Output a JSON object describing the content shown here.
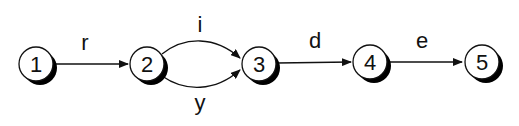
{
  "diagram": {
    "type": "state-transition-graph",
    "nodes": [
      {
        "id": "1",
        "label": "1",
        "cx": 36,
        "cy": 64
      },
      {
        "id": "2",
        "label": "2",
        "cx": 147,
        "cy": 64
      },
      {
        "id": "3",
        "label": "3",
        "cx": 259,
        "cy": 64
      },
      {
        "id": "4",
        "label": "4",
        "cx": 370,
        "cy": 62
      },
      {
        "id": "5",
        "label": "5",
        "cx": 482,
        "cy": 62
      }
    ],
    "edges": [
      {
        "from": "1",
        "to": "2",
        "label": "r"
      },
      {
        "from": "2",
        "to": "3",
        "label": "i"
      },
      {
        "from": "2",
        "to": "3",
        "label": "y"
      },
      {
        "from": "3",
        "to": "4",
        "label": "d"
      },
      {
        "from": "4",
        "to": "5",
        "label": "e"
      }
    ],
    "colors": {
      "stroke": "#111111",
      "fill": "#ffffff",
      "shadow": "#000000"
    }
  }
}
